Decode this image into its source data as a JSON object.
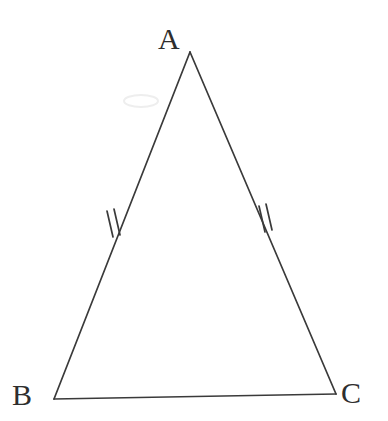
{
  "figure": {
    "type": "geometry-diagram",
    "background_color": "#ffffff",
    "stroke_color": "#3a3a3a",
    "label_color": "#2e2e2e",
    "stroke_width": 1.6,
    "canvas": {
      "width": 388,
      "height": 421
    },
    "vertices": [
      {
        "name": "A",
        "label": "A",
        "x": 190,
        "y": 52,
        "label_x": 172,
        "label_y": 40
      },
      {
        "name": "B",
        "label": "B",
        "x": 54,
        "y": 399,
        "label_x": 26,
        "label_y": 398
      },
      {
        "name": "C",
        "label": "C",
        "x": 336,
        "y": 394,
        "label_x": 355,
        "label_y": 396
      }
    ],
    "edges": [
      {
        "name": "AB",
        "from": "A",
        "to": "B",
        "tick_marks": 2
      },
      {
        "name": "AC",
        "from": "A",
        "to": "C",
        "tick_marks": 2
      },
      {
        "name": "BC",
        "from": "B",
        "to": "C",
        "tick_marks": 0
      }
    ],
    "tick_groups": [
      {
        "edge": "AB",
        "count": 2,
        "center_x": 114,
        "center_y": 224,
        "angle_deg": 12,
        "length": 26,
        "spacing": 7
      },
      {
        "edge": "AC",
        "count": 2,
        "center_x": 266,
        "center_y": 219,
        "angle_deg": -10,
        "length": 26,
        "spacing": 7
      }
    ],
    "artifact": {
      "name": "scan-smudge",
      "x": 140,
      "y": 100,
      "color": "#efefef"
    }
  }
}
